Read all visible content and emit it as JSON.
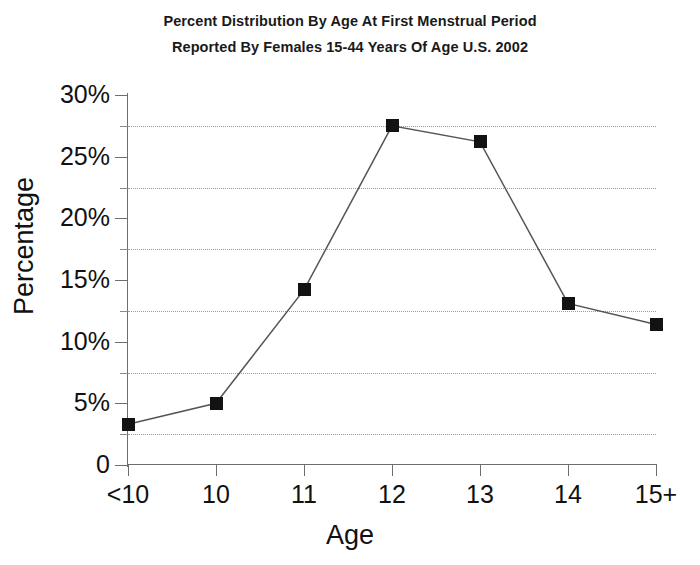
{
  "title": {
    "line1": "Percent Distribution By Age At First Menstrual Period",
    "line2": "Reported By Females 15-44 Years Of Age U.S. 2002"
  },
  "axes": {
    "x_title": "Age",
    "y_title": "Percentage"
  },
  "chart_data": {
    "type": "line",
    "title": "Percent Distribution By Age At First Menstrual Period Reported By Females 15-44 Years Of Age U.S. 2002",
    "xlabel": "Age",
    "ylabel": "Percentage",
    "categories": [
      "<10",
      "10",
      "11",
      "12",
      "13",
      "14",
      "15+"
    ],
    "values": [
      3.3,
      5.0,
      14.2,
      27.5,
      26.2,
      13.1,
      11.4
    ],
    "ylim": [
      0,
      30
    ],
    "y_ticks": [
      0,
      5,
      10,
      15,
      20,
      25,
      30
    ],
    "y_tick_labels": [
      "0",
      "5%",
      "10%",
      "15%",
      "20%",
      "25%",
      "30%"
    ],
    "y_minor_ticks": [
      2.5,
      7.5,
      12.5,
      17.5,
      22.5,
      27.5
    ],
    "gridlines": [
      2.5,
      7.5,
      12.5,
      17.5,
      22.5,
      27.5
    ],
    "grid": "horizontal-dotted",
    "legend": "none",
    "marker": "square",
    "marker_color": "#121212",
    "line_color": "#555555"
  }
}
